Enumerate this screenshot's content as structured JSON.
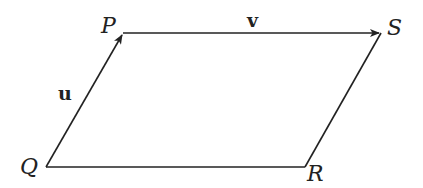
{
  "diagram": {
    "type": "parallelogram",
    "vertices": [
      {
        "name": "P",
        "x": 123,
        "y": 33,
        "label_x": 101,
        "label_y": 33
      },
      {
        "name": "S",
        "x": 381,
        "y": 33,
        "label_x": 387,
        "label_y": 35
      },
      {
        "name": "Q",
        "x": 46,
        "y": 167,
        "label_x": 20,
        "label_y": 174
      },
      {
        "name": "R",
        "x": 305,
        "y": 167,
        "label_x": 307,
        "label_y": 181
      }
    ],
    "vectors": [
      {
        "name": "u",
        "from": "Q",
        "to": "P",
        "label_x": 58,
        "label_y": 100
      },
      {
        "name": "v",
        "from": "P",
        "to": "S",
        "label_x": 247,
        "label_y": 27
      }
    ],
    "edges": [
      {
        "from": "S",
        "to": "R"
      },
      {
        "from": "Q",
        "to": "R"
      }
    ],
    "stroke_color": "#222222"
  }
}
